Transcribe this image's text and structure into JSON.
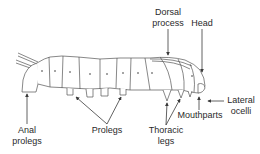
{
  "diagram": {
    "labels": {
      "dorsal_process": {
        "line1": "Dorsal",
        "line2": "process"
      },
      "head": {
        "line1": "Head"
      },
      "lateral_ocelli": {
        "line1": "Lateral",
        "line2": "ocelli"
      },
      "mouthparts": {
        "line1": "Mouthparts"
      },
      "thoracic_legs": {
        "line1": "Thoracic",
        "line2": "legs"
      },
      "prolegs": {
        "line1": "Prolegs"
      },
      "anal_prolegs": {
        "line1": "Anal",
        "line2": "prolegs"
      }
    },
    "colors": {
      "line": "#3a3a3a",
      "text": "#2a2a2a",
      "background": "#ffffff"
    }
  }
}
